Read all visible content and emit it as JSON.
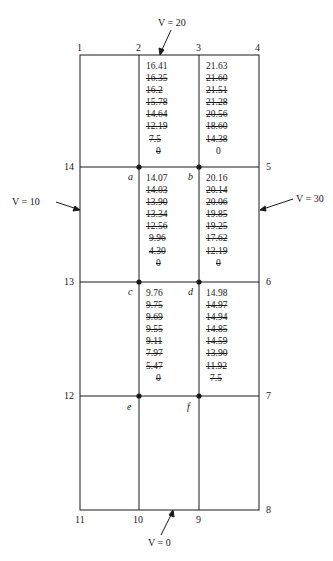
{
  "figure": {
    "corner_nodes": {
      "n1": "1",
      "n2": "2",
      "n3": "3",
      "n4": "4",
      "n5": "5",
      "n6": "6",
      "n7": "7",
      "n8": "8",
      "n9": "9",
      "n10": "10",
      "n11": "11",
      "n12": "12",
      "n13": "13",
      "n14": "14"
    },
    "interior_nodes": {
      "a": "a",
      "b": "b",
      "c": "c",
      "d": "d",
      "e": "e",
      "f": "f"
    },
    "boundary_conditions": {
      "top": "V = 20",
      "left": "V = 10",
      "right": "V = 30",
      "bottom": "V = 0"
    },
    "iterations": {
      "a": {
        "final": "14.07",
        "crossed": [
          "14.03",
          "13.90",
          "13.34",
          "12.56",
          "9.96",
          "4.30",
          "0"
        ]
      },
      "b": {
        "final": "20.16",
        "crossed": [
          "20.14",
          "20.06",
          "19.85",
          "19.25",
          "17.62",
          "12.19",
          "0"
        ]
      },
      "c": {
        "final": "9.76",
        "crossed": [
          "9.75",
          "9.69",
          "9.55",
          "9.11",
          "7.97",
          "5.47",
          "0"
        ]
      },
      "d": {
        "final": "14.98",
        "crossed": [
          "14.97",
          "14.94",
          "14.85",
          "14.59",
          "13.90",
          "11.92",
          "7.5"
        ]
      },
      "top_left": {
        "final": "16.41",
        "crossed": [
          "16.35",
          "16.2",
          "15.78",
          "14.64",
          "12.19",
          "7.5",
          "0"
        ]
      },
      "top_right": {
        "final": "21.63",
        "crossed": [
          "21.60",
          "21.51",
          "21.28",
          "20.56",
          "18.60",
          "14.38"
        ],
        "initial": "0"
      }
    },
    "colors": {
      "ink": "#1a1a1a",
      "background": "#ffffff"
    }
  }
}
